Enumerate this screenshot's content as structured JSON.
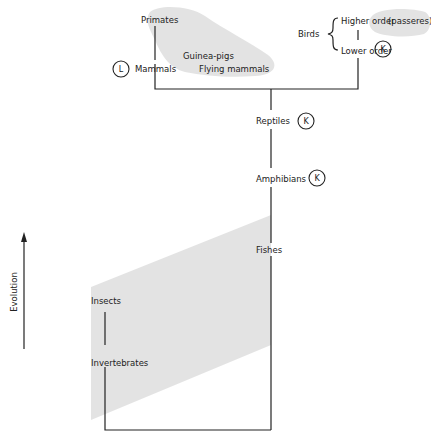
{
  "diagram": {
    "title": "",
    "axis": {
      "label": "Evolution",
      "direction": "up"
    },
    "nodes": {
      "primates": "Primates",
      "mammals": "Mammals",
      "guinea_pigs": "Guinea-pigs",
      "flying_mammals": "Flying mammals",
      "birds": "Birds",
      "birds_higher": "Higher order",
      "passeres": "(passeres)",
      "birds_lower": "Lower order",
      "reptiles": "Reptiles",
      "amphibians": "Amphibians",
      "fishes": "Fishes",
      "insects": "Insects",
      "invertebrates": "Invertebrates"
    },
    "markers": {
      "mammals": "L",
      "birds_lower": "K",
      "reptiles": "K",
      "amphibians": "K"
    },
    "colors": {
      "line": "#222222",
      "shade": "#d9d9d9",
      "background": "#ffffff"
    }
  }
}
